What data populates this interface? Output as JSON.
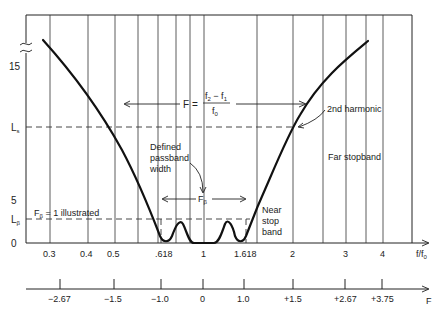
{
  "diagram": {
    "y_axis": {
      "ticks": [
        {
          "label": "15",
          "y": 66
        },
        {
          "label": "L_s",
          "y": 127
        },
        {
          "label": "5",
          "y": 200
        },
        {
          "label": "L_β",
          "y": 219
        },
        {
          "label": "0",
          "y": 243
        }
      ],
      "break_symbol": "≈"
    },
    "x_axis_ratio": {
      "label": "f/f0",
      "label_main": "f/f",
      "label_sub": "0",
      "ticks": [
        {
          "label": "0.3",
          "x": 50
        },
        {
          "label": "0.4",
          "x": 88
        },
        {
          "label": "0.5",
          "x": 115
        },
        {
          "label": ".618",
          "x": 158
        },
        {
          "label": "1",
          "x": 204
        },
        {
          "label": "1.618",
          "x": 248
        },
        {
          "label": "2",
          "x": 293
        },
        {
          "label": "3",
          "x": 346
        },
        {
          "label": "4",
          "x": 383
        }
      ]
    },
    "x_axis_F": {
      "label": "F",
      "ticks": [
        {
          "label": "−2.67",
          "x": 60
        },
        {
          "label": "−1.5",
          "x": 114
        },
        {
          "label": "−1.0",
          "x": 161
        },
        {
          "label": "0",
          "x": 203
        },
        {
          "label": "1.0",
          "x": 244
        },
        {
          "label": "+1.5",
          "x": 293
        },
        {
          "label": "+2.67",
          "x": 345
        },
        {
          "label": "+3.75",
          "x": 382
        }
      ]
    },
    "gridlines_x": [
      50,
      88,
      115,
      138,
      158,
      176,
      190,
      204,
      257,
      293,
      323,
      346,
      366,
      383
    ],
    "formula": {
      "lhs": "F =",
      "numerator": "f2 − f1",
      "num_f2": "f",
      "num_f2_sub": "2",
      "num_minus": " − f",
      "num_f1_sub": "1",
      "denominator": "f",
      "den_sub": "0"
    },
    "annotations": {
      "second_harmonic": "2nd harmonic",
      "far_stopband": "Far stopband",
      "defined_passband_1": "Defined",
      "defined_passband_2": "passband",
      "defined_passband_3": "width",
      "f_beta": "F",
      "f_beta_sub": "β",
      "f_beta_illustrated_main": "F",
      "f_beta_illustrated_sub": "β",
      "f_beta_illustrated_rest": " = 1 illustrated",
      "near_stop_1": "Near",
      "near_stop_2": "stop",
      "near_stop_3": "band",
      "y_L": "L",
      "y_Ls_sub": "s",
      "y_Lb_sub": "β"
    },
    "colors": {
      "curve": "#111111",
      "grid": "#333333",
      "background": "#ffffff"
    }
  }
}
